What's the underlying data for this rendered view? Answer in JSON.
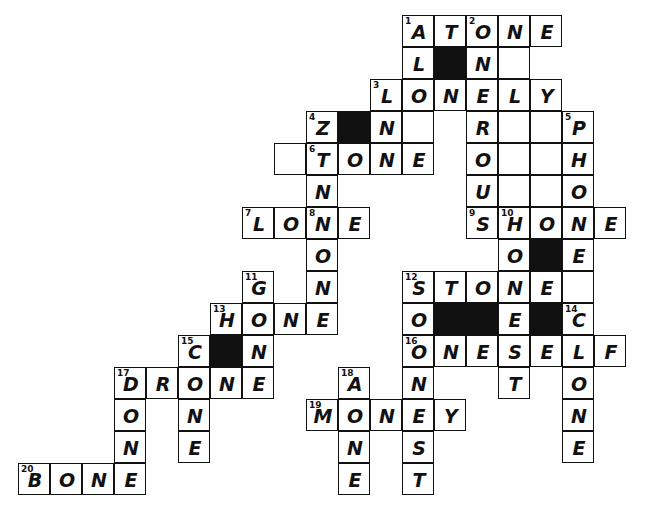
{
  "puzzle": {
    "title": "Crossword Grid",
    "cell_size": 32,
    "origin_x": 18,
    "origin_y": 15,
    "columns": 19,
    "rows": 15,
    "colors": {
      "background": "#ffffff",
      "grid_line": "#111111",
      "block": "#111111",
      "letter": "#111111",
      "number": "#111111"
    },
    "cells": [
      {
        "r": 0,
        "c": 12,
        "letter": "A",
        "num": "1"
      },
      {
        "r": 0,
        "c": 13,
        "letter": "T",
        "num": ""
      },
      {
        "r": 0,
        "c": 14,
        "letter": "O",
        "num": "2"
      },
      {
        "r": 0,
        "c": 15,
        "letter": "N",
        "num": ""
      },
      {
        "r": 0,
        "c": 16,
        "letter": "E",
        "num": ""
      },
      {
        "r": 1,
        "c": 12,
        "letter": "L",
        "num": ""
      },
      {
        "r": 1,
        "c": 13,
        "letter": "",
        "num": "",
        "black": true
      },
      {
        "r": 1,
        "c": 14,
        "letter": "N",
        "num": ""
      },
      {
        "r": 1,
        "c": 15,
        "letter": "",
        "num": ""
      },
      {
        "r": 2,
        "c": 11,
        "letter": "L",
        "num": "3"
      },
      {
        "r": 2,
        "c": 12,
        "letter": "O",
        "num": ""
      },
      {
        "r": 2,
        "c": 13,
        "letter": "N",
        "num": ""
      },
      {
        "r": 2,
        "c": 14,
        "letter": "E",
        "num": ""
      },
      {
        "r": 2,
        "c": 15,
        "letter": "L",
        "num": ""
      },
      {
        "r": 2,
        "c": 16,
        "letter": "Y",
        "num": ""
      },
      {
        "r": 3,
        "c": 9,
        "letter": "Z",
        "num": "4"
      },
      {
        "r": 3,
        "c": 10,
        "letter": "",
        "num": "",
        "black": true
      },
      {
        "r": 3,
        "c": 11,
        "letter": "N",
        "num": ""
      },
      {
        "r": 3,
        "c": 12,
        "letter": "",
        "num": ""
      },
      {
        "r": 3,
        "c": 14,
        "letter": "R",
        "num": ""
      },
      {
        "r": 3,
        "c": 15,
        "letter": "",
        "num": ""
      },
      {
        "r": 3,
        "c": 16,
        "letter": "",
        "num": ""
      },
      {
        "r": 3,
        "c": 17,
        "letter": "P",
        "num": "5"
      },
      {
        "r": 4,
        "c": 8,
        "letter": "",
        "num": ""
      },
      {
        "r": 4,
        "c": 9,
        "letter": "T",
        "num": "6"
      },
      {
        "r": 4,
        "c": 10,
        "letter": "O",
        "num": ""
      },
      {
        "r": 4,
        "c": 11,
        "letter": "N",
        "num": ""
      },
      {
        "r": 4,
        "c": 12,
        "letter": "E",
        "num": ""
      },
      {
        "r": 4,
        "c": 14,
        "letter": "O",
        "num": ""
      },
      {
        "r": 4,
        "c": 15,
        "letter": "",
        "num": ""
      },
      {
        "r": 4,
        "c": 16,
        "letter": "",
        "num": ""
      },
      {
        "r": 4,
        "c": 17,
        "letter": "H",
        "num": ""
      },
      {
        "r": 5,
        "c": 9,
        "letter": "N",
        "num": ""
      },
      {
        "r": 5,
        "c": 14,
        "letter": "U",
        "num": ""
      },
      {
        "r": 5,
        "c": 15,
        "letter": "",
        "num": ""
      },
      {
        "r": 5,
        "c": 16,
        "letter": "",
        "num": ""
      },
      {
        "r": 5,
        "c": 17,
        "letter": "O",
        "num": ""
      },
      {
        "r": 6,
        "c": 7,
        "letter": "L",
        "num": "7"
      },
      {
        "r": 6,
        "c": 8,
        "letter": "O",
        "num": ""
      },
      {
        "r": 6,
        "c": 9,
        "letter": "N",
        "num": "8"
      },
      {
        "r": 6,
        "c": 10,
        "letter": "E",
        "num": ""
      },
      {
        "r": 6,
        "c": 14,
        "letter": "S",
        "num": "9"
      },
      {
        "r": 6,
        "c": 15,
        "letter": "H",
        "num": "10"
      },
      {
        "r": 6,
        "c": 16,
        "letter": "O",
        "num": ""
      },
      {
        "r": 6,
        "c": 17,
        "letter": "N",
        "num": ""
      },
      {
        "r": 6,
        "c": 18,
        "letter": "E",
        "num": ""
      },
      {
        "r": 7,
        "c": 9,
        "letter": "O",
        "num": ""
      },
      {
        "r": 7,
        "c": 15,
        "letter": "O",
        "num": ""
      },
      {
        "r": 7,
        "c": 16,
        "letter": "",
        "num": "",
        "black": true
      },
      {
        "r": 7,
        "c": 17,
        "letter": "E",
        "num": ""
      },
      {
        "r": 8,
        "c": 7,
        "letter": "G",
        "num": "11"
      },
      {
        "r": 8,
        "c": 9,
        "letter": "N",
        "num": ""
      },
      {
        "r": 8,
        "c": 12,
        "letter": "S",
        "num": "12"
      },
      {
        "r": 8,
        "c": 13,
        "letter": "T",
        "num": ""
      },
      {
        "r": 8,
        "c": 14,
        "letter": "O",
        "num": ""
      },
      {
        "r": 8,
        "c": 15,
        "letter": "N",
        "num": ""
      },
      {
        "r": 8,
        "c": 16,
        "letter": "E",
        "num": ""
      },
      {
        "r": 8,
        "c": 17,
        "letter": "",
        "num": ""
      },
      {
        "r": 9,
        "c": 6,
        "letter": "H",
        "num": "13"
      },
      {
        "r": 9,
        "c": 7,
        "letter": "O",
        "num": ""
      },
      {
        "r": 9,
        "c": 8,
        "letter": "N",
        "num": ""
      },
      {
        "r": 9,
        "c": 9,
        "letter": "E",
        "num": ""
      },
      {
        "r": 9,
        "c": 12,
        "letter": "O",
        "num": ""
      },
      {
        "r": 9,
        "c": 13,
        "letter": "",
        "num": "",
        "black": true
      },
      {
        "r": 9,
        "c": 14,
        "letter": "",
        "num": "",
        "black": true
      },
      {
        "r": 9,
        "c": 15,
        "letter": "E",
        "num": ""
      },
      {
        "r": 9,
        "c": 16,
        "letter": "",
        "num": "",
        "black": true
      },
      {
        "r": 9,
        "c": 17,
        "letter": "C",
        "num": "14"
      },
      {
        "r": 10,
        "c": 5,
        "letter": "C",
        "num": "15"
      },
      {
        "r": 10,
        "c": 6,
        "letter": "",
        "num": "",
        "black": true
      },
      {
        "r": 10,
        "c": 7,
        "letter": "N",
        "num": ""
      },
      {
        "r": 10,
        "c": 12,
        "letter": "O",
        "num": "16"
      },
      {
        "r": 10,
        "c": 13,
        "letter": "N",
        "num": ""
      },
      {
        "r": 10,
        "c": 14,
        "letter": "E",
        "num": ""
      },
      {
        "r": 10,
        "c": 15,
        "letter": "S",
        "num": ""
      },
      {
        "r": 10,
        "c": 16,
        "letter": "E",
        "num": ""
      },
      {
        "r": 10,
        "c": 17,
        "letter": "L",
        "num": ""
      },
      {
        "r": 10,
        "c": 18,
        "letter": "F",
        "num": ""
      },
      {
        "r": 11,
        "c": 3,
        "letter": "D",
        "num": "17"
      },
      {
        "r": 11,
        "c": 4,
        "letter": "R",
        "num": ""
      },
      {
        "r": 11,
        "c": 5,
        "letter": "O",
        "num": ""
      },
      {
        "r": 11,
        "c": 6,
        "letter": "N",
        "num": ""
      },
      {
        "r": 11,
        "c": 7,
        "letter": "E",
        "num": ""
      },
      {
        "r": 11,
        "c": 10,
        "letter": "A",
        "num": "18"
      },
      {
        "r": 11,
        "c": 12,
        "letter": "N",
        "num": ""
      },
      {
        "r": 11,
        "c": 15,
        "letter": "T",
        "num": ""
      },
      {
        "r": 11,
        "c": 17,
        "letter": "O",
        "num": ""
      },
      {
        "r": 12,
        "c": 3,
        "letter": "O",
        "num": ""
      },
      {
        "r": 12,
        "c": 5,
        "letter": "N",
        "num": ""
      },
      {
        "r": 12,
        "c": 9,
        "letter": "M",
        "num": "19"
      },
      {
        "r": 12,
        "c": 10,
        "letter": "O",
        "num": ""
      },
      {
        "r": 12,
        "c": 11,
        "letter": "N",
        "num": ""
      },
      {
        "r": 12,
        "c": 12,
        "letter": "E",
        "num": ""
      },
      {
        "r": 12,
        "c": 13,
        "letter": "Y",
        "num": ""
      },
      {
        "r": 12,
        "c": 17,
        "letter": "N",
        "num": ""
      },
      {
        "r": 13,
        "c": 3,
        "letter": "N",
        "num": ""
      },
      {
        "r": 13,
        "c": 5,
        "letter": "E",
        "num": ""
      },
      {
        "r": 13,
        "c": 10,
        "letter": "N",
        "num": ""
      },
      {
        "r": 13,
        "c": 12,
        "letter": "S",
        "num": ""
      },
      {
        "r": 13,
        "c": 17,
        "letter": "E",
        "num": ""
      },
      {
        "r": 14,
        "c": 0,
        "letter": "B",
        "num": "20"
      },
      {
        "r": 14,
        "c": 1,
        "letter": "O",
        "num": ""
      },
      {
        "r": 14,
        "c": 2,
        "letter": "N",
        "num": ""
      },
      {
        "r": 14,
        "c": 3,
        "letter": "E",
        "num": ""
      },
      {
        "r": 14,
        "c": 10,
        "letter": "E",
        "num": ""
      },
      {
        "r": 14,
        "c": 12,
        "letter": "T",
        "num": ""
      }
    ]
  }
}
